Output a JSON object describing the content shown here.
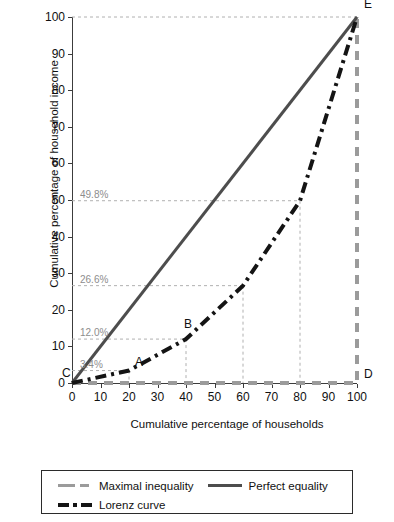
{
  "chart_data": {
    "type": "line",
    "title": "",
    "xlabel": "Cumulative percentage of households",
    "ylabel": "Cumulative percentage of household income",
    "xlim": [
      0,
      100
    ],
    "ylim": [
      0,
      100
    ],
    "xticks": [
      0,
      10,
      20,
      30,
      40,
      50,
      60,
      70,
      80,
      90,
      100
    ],
    "yticks": [
      0,
      10,
      20,
      30,
      40,
      50,
      60,
      70,
      80,
      90,
      100
    ],
    "grid": "dashed-annotation-guides-only",
    "legend_position": "bottom",
    "series": [
      {
        "name": "Maximal inequality",
        "color": "#9b9b9b",
        "style": "dashed",
        "x": [
          0,
          100,
          100
        ],
        "y": [
          0,
          0,
          100
        ]
      },
      {
        "name": "Perfect equality",
        "color": "#4d4d4d",
        "style": "solid",
        "x": [
          0,
          100
        ],
        "y": [
          0,
          100
        ]
      },
      {
        "name": "Lorenz curve",
        "color": "#141414",
        "style": "dash-dot",
        "x": [
          0,
          20,
          40,
          60,
          80,
          100
        ],
        "y": [
          0,
          3.4,
          12.0,
          26.6,
          49.8,
          100
        ]
      }
    ],
    "annotations": [
      {
        "name": "pct-3-4",
        "text": "3.4%",
        "x": 20,
        "y": 3.4
      },
      {
        "name": "pct-12-0",
        "text": "12.0%",
        "x": 40,
        "y": 12.0
      },
      {
        "name": "pct-26-6",
        "text": "26.6%",
        "x": 60,
        "y": 26.6
      },
      {
        "name": "pct-49-8",
        "text": "49.8%",
        "x": 80,
        "y": 49.8
      }
    ],
    "points": [
      {
        "label": "C",
        "x": 0,
        "y": 0
      },
      {
        "label": "A",
        "x": 20,
        "y": 3.4
      },
      {
        "label": "B",
        "x": 40,
        "y": 12.0
      },
      {
        "label": "D",
        "x": 100,
        "y": 0
      },
      {
        "label": "E",
        "x": 100,
        "y": 100
      }
    ]
  },
  "legend": {
    "items": [
      {
        "label": "Maximal inequality"
      },
      {
        "label": "Perfect equality"
      },
      {
        "label": "Lorenz curve"
      }
    ]
  },
  "axis": {
    "ylabel": "Cumulative percentage of household income",
    "xlabel": "Cumulative percentage of households",
    "ytick_labels": [
      "0",
      "10",
      "20",
      "30",
      "40",
      "50",
      "60",
      "70",
      "80",
      "90",
      "100"
    ],
    "xtick_labels": [
      "0",
      "10",
      "20",
      "30",
      "40",
      "50",
      "60",
      "70",
      "80",
      "90",
      "100"
    ]
  }
}
